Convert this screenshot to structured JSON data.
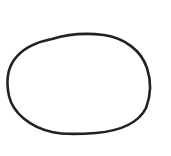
{
  "drawing": {
    "shape": "hand-drawn-oval",
    "stroke_color": "#222222",
    "background_color": "#ffffff",
    "stroke_width": 2.6
  }
}
